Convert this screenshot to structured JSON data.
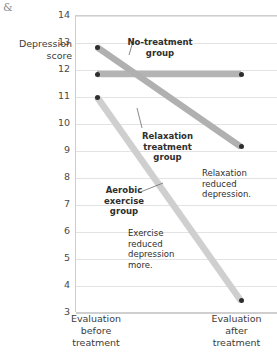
{
  "page": {
    "corner_glyph": "&"
  },
  "chart_data": {
    "type": "line",
    "title": "",
    "xlabel": "",
    "ylabel": "Depression score",
    "ylabel_lines": [
      "Depression",
      "score"
    ],
    "categories": [
      "Evaluation before treatment",
      "Evaluation after treatment"
    ],
    "category_lines": [
      [
        "Evaluation",
        "before",
        "treatment"
      ],
      [
        "Evaluation",
        "after",
        "treatment"
      ]
    ],
    "ylim": [
      3,
      14
    ],
    "yticks": [
      14,
      13,
      12,
      11,
      10,
      9,
      8,
      7,
      6,
      5,
      4,
      3
    ],
    "grid": true,
    "legend": "none",
    "series": [
      {
        "name": "No-treatment group",
        "values": [
          11.85,
          11.85
        ],
        "color": "#b4b4b4"
      },
      {
        "name": "Relaxation treatment group",
        "values": [
          12.85,
          9.15
        ],
        "color": "#b0b0b0"
      },
      {
        "name": "Aerobic exercise group",
        "values": [
          11.0,
          3.45
        ],
        "color": "#cfcfcf"
      }
    ],
    "annotations": [
      {
        "id": "no-treatment",
        "lines": [
          "No-treatment",
          "group"
        ],
        "bold": true
      },
      {
        "id": "relaxation",
        "lines": [
          "Relaxation",
          "treatment",
          "group"
        ],
        "bold": true
      },
      {
        "id": "aerobic",
        "lines": [
          "Aerobic",
          "exercise",
          "group"
        ],
        "bold": true
      },
      {
        "id": "relaxation-note",
        "lines": [
          "Relaxation",
          "reduced",
          "depression."
        ],
        "bold": false
      },
      {
        "id": "exercise-note",
        "lines": [
          "Exercise",
          "reduced",
          "depression",
          "more."
        ],
        "bold": false
      }
    ],
    "colors": {
      "marker": "#2e2e2e",
      "gridline": "#e3e3e3",
      "axis": "#cfcfcf",
      "text": "#3b3b3b"
    }
  }
}
